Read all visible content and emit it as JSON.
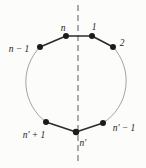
{
  "diagram": {
    "labels": {
      "n": "n",
      "one": "1",
      "two": "2",
      "n_minus_1": "n − 1",
      "n_prime_plus_1": "n′ + 1",
      "n_prime": "n′",
      "n_prime_minus_1": "n′ − 1"
    },
    "colors": {
      "background": "#fcfcfa",
      "edge_stroke": "#2b2b2b",
      "arc_stroke": "#8c8c8c",
      "axis_stroke": "#5a5a5a",
      "label_color": "#242424"
    }
  }
}
